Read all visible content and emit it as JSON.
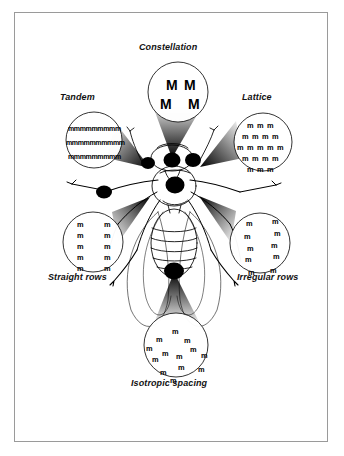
{
  "figure": {
    "background_color": "#ffffff",
    "frame_color": "#9a9a9a",
    "ink_color": "#000000"
  },
  "callouts": [
    {
      "id": "constellation",
      "label": "Constellation",
      "label_x": 139,
      "label_y": 49,
      "circle": {
        "cx": 178,
        "cy": 92,
        "r": 30
      },
      "cone": {
        "apex_x": 172,
        "apex_y": 157,
        "spread": 26
      },
      "glyph": "M",
      "glyph_class": "big",
      "pattern": "scattered-large",
      "points": [
        [
          166,
          78
        ],
        [
          184,
          78
        ],
        [
          160,
          97
        ],
        [
          188,
          97
        ]
      ]
    },
    {
      "id": "tandem",
      "label": "Tandem",
      "label_x": 60,
      "label_y": 98,
      "circle": {
        "cx": 94,
        "cy": 140,
        "r": 28
      },
      "cone": {
        "apex_x": 150,
        "apex_y": 168,
        "spread": 24
      },
      "glyph": "mmmmmmmmm",
      "glyph_class": "tight",
      "pattern": "dense-rows",
      "rows": [
        {
          "x": 68,
          "y": 125,
          "text": "mmmmmmmmm"
        },
        {
          "x": 66,
          "y": 139,
          "text": "mmmmmmmmmm"
        },
        {
          "x": 68,
          "y": 153,
          "text": "mmmmmmmmm"
        }
      ]
    },
    {
      "id": "lattice",
      "label": "Lattice",
      "label_x": 243,
      "label_y": 98,
      "circle": {
        "cx": 263,
        "cy": 142,
        "r": 29
      },
      "cone": {
        "apex_x": 202,
        "apex_y": 168,
        "spread": 24
      },
      "glyph": "m",
      "glyph_class": "",
      "pattern": "hex-lattice",
      "rows": [
        {
          "y": 122,
          "xs": [
            247,
            257,
            267
          ]
        },
        {
          "y": 133,
          "xs": [
            242,
            252,
            262,
            272
          ]
        },
        {
          "y": 144,
          "xs": [
            237,
            247,
            257,
            267,
            277
          ]
        },
        {
          "y": 155,
          "xs": [
            242,
            252,
            262,
            272
          ]
        },
        {
          "y": 166,
          "xs": [
            247,
            257,
            267
          ]
        }
      ]
    },
    {
      "id": "straight-rows",
      "label": "Straight rows",
      "label_x": 50,
      "label_y": 274,
      "circle": {
        "cx": 93,
        "cy": 242,
        "r": 30
      },
      "cone": {
        "apex_x": 150,
        "apex_y": 196,
        "spread": 24
      },
      "glyph": "m",
      "glyph_class": "",
      "pattern": "two-straight-columns",
      "columns": [
        {
          "x": 77,
          "ys": [
            221,
            232,
            243,
            254,
            265
          ]
        },
        {
          "x": 104,
          "ys": [
            221,
            232,
            243,
            254,
            265
          ]
        }
      ]
    },
    {
      "id": "irregular-rows",
      "label": "Irregular rows",
      "label_x": 239,
      "label_y": 274,
      "circle": {
        "cx": 260,
        "cy": 243,
        "r": 30
      },
      "cone": {
        "apex_x": 198,
        "apex_y": 196,
        "spread": 24
      },
      "glyph": "m",
      "glyph_class": "",
      "pattern": "two-jittered-columns",
      "columns": [
        {
          "x": 246,
          "ys": [
            220,
            233,
            245,
            256,
            269
          ]
        },
        {
          "x": 272,
          "ys": [
            218,
            230,
            242,
            253,
            267
          ]
        },
        {
          "jitter_x": [
            0,
            -2,
            1,
            -1,
            2
          ]
        }
      ]
    },
    {
      "id": "isotropic-spacing",
      "label": "Isotropic spacing",
      "label_x": 133,
      "label_y": 381,
      "circle": {
        "cx": 176,
        "cy": 345,
        "r": 32
      },
      "cone": {
        "apex_x": 174,
        "apex_y": 272,
        "spread": 26
      },
      "glyph": "m",
      "glyph_class": "",
      "pattern": "random-scatter",
      "points": [
        [
          172,
          328
        ],
        [
          156,
          336
        ],
        [
          184,
          337
        ],
        [
          162,
          350
        ],
        [
          176,
          353
        ],
        [
          201,
          352
        ],
        [
          152,
          356
        ],
        [
          178,
          364
        ],
        [
          198,
          366
        ],
        [
          160,
          369
        ],
        [
          170,
          377
        ],
        [
          190,
          346
        ],
        [
          146,
          345
        ]
      ]
    }
  ],
  "receptor_dots": [
    {
      "id": "dot-left-antenna-base",
      "cx": 148,
      "cy": 163,
      "rx": 7,
      "ry": 6
    },
    {
      "id": "dot-center-head",
      "cx": 172,
      "cy": 160,
      "rx": 8,
      "ry": 7
    },
    {
      "id": "dot-right-antenna-base",
      "cx": 193,
      "cy": 160,
      "rx": 8,
      "ry": 7
    },
    {
      "id": "dot-thorax",
      "cx": 175,
      "cy": 185,
      "rx": 9,
      "ry": 8
    },
    {
      "id": "dot-left-leg",
      "cx": 104,
      "cy": 192,
      "rx": 8,
      "ry": 6
    },
    {
      "id": "dot-abdomen-tip",
      "cx": 174,
      "cy": 271,
      "rx": 10,
      "ry": 8
    }
  ]
}
